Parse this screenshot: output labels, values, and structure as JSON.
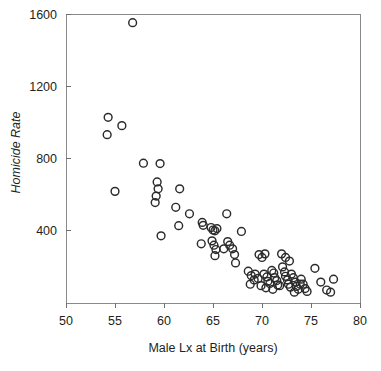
{
  "chart_data": {
    "type": "scatter",
    "title": "",
    "xlabel": "Male Lx at Birth (years)",
    "ylabel": "Homicide Rate",
    "xlim": [
      50,
      80
    ],
    "ylim": [
      0,
      1600
    ],
    "xticks": [
      50,
      55,
      60,
      65,
      70,
      75,
      80
    ],
    "xtick_labels": [
      "50",
      "55",
      "60",
      "65",
      "70",
      "75",
      "80"
    ],
    "yticks": [
      400,
      800,
      1200,
      1600
    ],
    "ytick_labels": [
      "400",
      "800",
      "1200",
      "1600"
    ],
    "grid": false,
    "legend": null,
    "marker": "open-circle",
    "marker_color": "#2b2b2b",
    "points": [
      [
        56.8,
        1552
      ],
      [
        54.3,
        1028
      ],
      [
        54.2,
        932
      ],
      [
        55.7,
        982
      ],
      [
        55.0,
        618
      ],
      [
        57.9,
        774
      ],
      [
        59.6,
        772
      ],
      [
        59.3,
        670
      ],
      [
        59.4,
        632
      ],
      [
        59.2,
        592
      ],
      [
        59.1,
        556
      ],
      [
        59.7,
        372
      ],
      [
        61.6,
        632
      ],
      [
        61.2,
        530
      ],
      [
        61.5,
        428
      ],
      [
        62.6,
        494
      ],
      [
        63.9,
        446
      ],
      [
        64.0,
        430
      ],
      [
        63.8,
        328
      ],
      [
        64.8,
        418
      ],
      [
        65.0,
        404
      ],
      [
        65.2,
        400
      ],
      [
        65.4,
        412
      ],
      [
        64.9,
        344
      ],
      [
        65.1,
        320
      ],
      [
        65.3,
        296
      ],
      [
        65.2,
        262
      ],
      [
        66.4,
        494
      ],
      [
        66.5,
        340
      ],
      [
        66.7,
        320
      ],
      [
        67.0,
        300
      ],
      [
        67.2,
        268
      ],
      [
        67.3,
        222
      ],
      [
        67.9,
        396
      ],
      [
        68.6,
        176
      ],
      [
        68.9,
        152
      ],
      [
        69.3,
        160
      ],
      [
        69.2,
        128
      ],
      [
        69.6,
        136
      ],
      [
        69.7,
        268
      ],
      [
        70.0,
        252
      ],
      [
        70.3,
        272
      ],
      [
        70.2,
        160
      ],
      [
        70.5,
        144
      ],
      [
        70.6,
        120
      ],
      [
        70.8,
        108
      ],
      [
        71.0,
        180
      ],
      [
        71.2,
        166
      ],
      [
        71.3,
        140
      ],
      [
        71.5,
        124
      ],
      [
        71.6,
        100
      ],
      [
        71.8,
        96
      ],
      [
        72.0,
        272
      ],
      [
        72.1,
        200
      ],
      [
        72.3,
        172
      ],
      [
        72.4,
        148
      ],
      [
        72.6,
        128
      ],
      [
        72.7,
        104
      ],
      [
        72.9,
        88
      ],
      [
        73.0,
        160
      ],
      [
        73.2,
        140
      ],
      [
        73.4,
        116
      ],
      [
        73.5,
        92
      ],
      [
        73.7,
        76
      ],
      [
        73.9,
        104
      ],
      [
        72.4,
        252
      ],
      [
        72.8,
        232
      ],
      [
        74.0,
        132
      ],
      [
        74.2,
        104
      ],
      [
        74.4,
        80
      ],
      [
        74.6,
        64
      ],
      [
        75.4,
        192
      ],
      [
        76.0,
        116
      ],
      [
        76.6,
        72
      ],
      [
        77.0,
        60
      ],
      [
        77.3,
        132
      ],
      [
        69.9,
        96
      ],
      [
        70.4,
        84
      ],
      [
        71.1,
        76
      ],
      [
        73.3,
        60
      ],
      [
        68.8,
        104
      ],
      [
        66.1,
        300
      ]
    ]
  }
}
